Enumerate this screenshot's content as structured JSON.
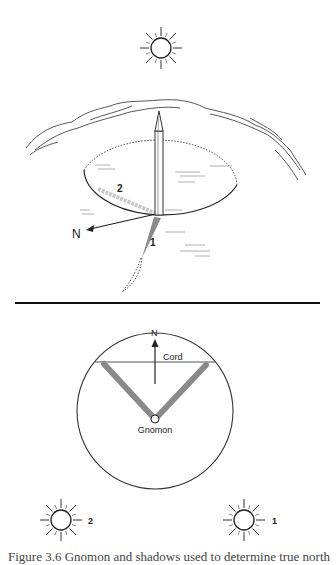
{
  "figure": {
    "top_panel": {
      "labels": {
        "north": "N",
        "shadow_1": "1",
        "shadow_2": "2"
      },
      "elements": [
        "sun-overhead",
        "horizon-skyline",
        "gnomon",
        "ground-circle",
        "north-arrow",
        "shadow-1",
        "shadow-2"
      ]
    },
    "bottom_panel": {
      "labels": {
        "north": "N",
        "cord": "Cord",
        "gnomon": "Gnomon",
        "sun_left": "2",
        "sun_right": "1"
      },
      "elements": [
        "circle",
        "cord-line",
        "north-arrow",
        "shadow-left",
        "shadow-right",
        "gnomon-base",
        "sun-left",
        "sun-right"
      ]
    },
    "caption": "Figure 3.6  Gnomon and shadows used to determine true north"
  },
  "colors": {
    "ink": "#222222",
    "shadow": "#8a8a8a",
    "background": "#ffffff"
  }
}
